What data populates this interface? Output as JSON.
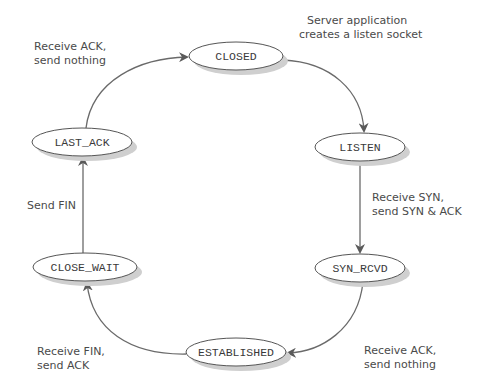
{
  "diagram": {
    "states": [
      {
        "id": "closed",
        "label": "CLOSED",
        "cx": 236,
        "cy": 56,
        "rx": 47,
        "ry": 14
      },
      {
        "id": "listen",
        "label": "LISTEN",
        "cx": 360,
        "cy": 147,
        "rx": 45,
        "ry": 14
      },
      {
        "id": "syn_rcvd",
        "label": "SYN_RCVD",
        "cx": 360,
        "cy": 268,
        "rx": 45,
        "ry": 14
      },
      {
        "id": "established",
        "label": "ESTABLISHED",
        "cx": 236,
        "cy": 352,
        "rx": 50,
        "ry": 14
      },
      {
        "id": "close_wait",
        "label": "CLOSE_WAIT",
        "cx": 85,
        "cy": 267,
        "rx": 52,
        "ry": 14
      },
      {
        "id": "last_ack",
        "label": "LAST_ACK",
        "cx": 82,
        "cy": 142,
        "rx": 50,
        "ry": 14
      }
    ],
    "transitions": [
      {
        "from": "closed",
        "to": "listen",
        "label_lines": [
          "Server application",
          "creates a listen socket"
        ]
      },
      {
        "from": "listen",
        "to": "syn_rcvd",
        "label_lines": [
          "Receive SYN,",
          "send SYN & ACK"
        ]
      },
      {
        "from": "syn_rcvd",
        "to": "established",
        "label_lines": [
          "Receive ACK,",
          "send nothing"
        ]
      },
      {
        "from": "established",
        "to": "close_wait",
        "label_lines": [
          "Receive FIN,",
          "send ACK"
        ]
      },
      {
        "from": "close_wait",
        "to": "last_ack",
        "label_lines": [
          "Send FIN"
        ]
      },
      {
        "from": "last_ack",
        "to": "closed",
        "label_lines": [
          "Receive ACK,",
          "send nothing"
        ]
      }
    ],
    "colors": {
      "stroke": "#555555",
      "edge": "#6a6a6a",
      "shadow": "#cfcfcf",
      "text": "#3a3a3a"
    }
  }
}
